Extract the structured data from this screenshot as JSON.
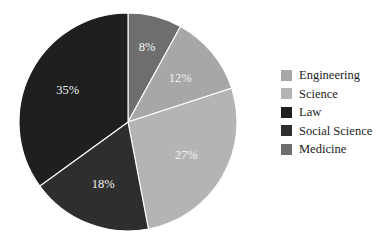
{
  "chart_data": {
    "type": "pie",
    "title": "",
    "categories": [
      "Engineering",
      "Science",
      "Law",
      "Social Science",
      "Medicine"
    ],
    "values": [
      12,
      27,
      35,
      18,
      8
    ],
    "value_labels": [
      "12%",
      "27%",
      "35%",
      "18%",
      "8%"
    ],
    "units": "percent",
    "colors": [
      "#a7a7a7",
      "#b4b4b4",
      "#1f1f1f",
      "#2e2e2e",
      "#6e6e6e"
    ],
    "legend_position": "right",
    "grid": false,
    "start_angle_deg": 0,
    "direction": "clockwise",
    "slice_order_clockwise_from_top": [
      "Medicine",
      "Engineering",
      "Science",
      "Social Science",
      "Law"
    ],
    "slices": [
      {
        "label": "Medicine",
        "value": 8,
        "value_label": "8%",
        "color": "#6e6e6e",
        "label_color": "#ededed"
      },
      {
        "label": "Engineering",
        "value": 12,
        "value_label": "12%",
        "color": "#a7a7a7",
        "label_color": "#f7f7f7"
      },
      {
        "label": "Science",
        "value": 27,
        "value_label": "27%",
        "color": "#b4b4b4",
        "label_color": "#f7f7f7"
      },
      {
        "label": "Social Science",
        "value": 18,
        "value_label": "18%",
        "color": "#2e2e2e",
        "label_color": "#ededed"
      },
      {
        "label": "Law",
        "value": 35,
        "value_label": "35%",
        "color": "#1f1f1f",
        "label_color": "#ededed"
      }
    ]
  },
  "legend": {
    "items": [
      {
        "label": "Engineering",
        "color": "#a7a7a7"
      },
      {
        "label": "Science",
        "color": "#b4b4b4"
      },
      {
        "label": "Law",
        "color": "#1f1f1f"
      },
      {
        "label": "Social Science",
        "color": "#2e2e2e"
      },
      {
        "label": "Medicine",
        "color": "#6e6e6e"
      }
    ]
  }
}
